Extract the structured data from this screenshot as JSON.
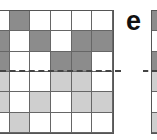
{
  "panel_label": "e",
  "colors": {
    "white": "#ffffff",
    "dark": "#8c8c8c",
    "light": "#cfcfcf",
    "grid_line": "#666666",
    "dashed_line": "#444444"
  },
  "left_grid": {
    "rows": [
      [
        "w",
        "d",
        "w",
        "w",
        "w",
        "w"
      ],
      [
        "d",
        "w",
        "d",
        "w",
        "d",
        "d"
      ],
      [
        "d",
        "w",
        "w",
        "d",
        "d",
        "w"
      ],
      [
        "l",
        "w",
        "w",
        "l",
        "l",
        "w"
      ],
      [
        "l",
        "w",
        "l",
        "w",
        "l",
        "l"
      ],
      [
        "w",
        "l",
        "w",
        "w",
        "w",
        "w"
      ]
    ]
  },
  "right_grid": {
    "rows": [
      [
        "d"
      ],
      [
        "w"
      ],
      [
        "d"
      ],
      [
        "l"
      ],
      [
        "w"
      ],
      [
        "l"
      ]
    ]
  },
  "dashed_divider": {
    "position": "between row 3 and row 4",
    "style": "dashed"
  }
}
